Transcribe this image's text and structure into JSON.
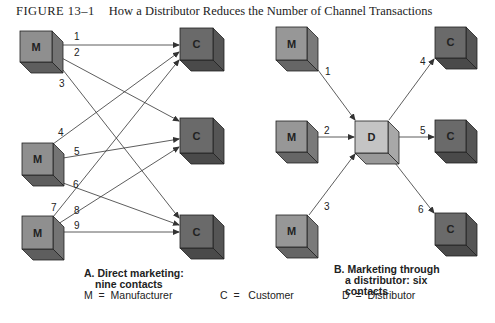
{
  "figure": {
    "number": "FIGURE 13–1",
    "title": "How a Distributor Reduces the Number of Channel Transactions"
  },
  "colors": {
    "manufacturer_face": "#8f8f8f",
    "customer_face": "#6a6a6a",
    "distributor_face": "#c4c4c4",
    "line": "#333333"
  },
  "panel_a": {
    "caption_line1": "A. Direct marketing:",
    "caption_line2": "nine contacts",
    "manufacturers": [
      "M",
      "M",
      "M"
    ],
    "customers": [
      "C",
      "C",
      "C"
    ],
    "contacts": [
      "1",
      "2",
      "3",
      "4",
      "5",
      "6",
      "7",
      "8",
      "9"
    ]
  },
  "panel_b": {
    "caption_line1": "B. Marketing through",
    "caption_line2": "a distributor: six",
    "caption_line3": "contacts",
    "manufacturers": [
      "M",
      "M",
      "M"
    ],
    "distributor": "D",
    "customers": [
      "C",
      "C",
      "C"
    ],
    "contacts": [
      "1",
      "2",
      "3",
      "4",
      "5",
      "6"
    ]
  },
  "legend": {
    "m": "M  =  Manufacturer",
    "c": "C  =   Customer",
    "d": "D  =  Distributor"
  }
}
